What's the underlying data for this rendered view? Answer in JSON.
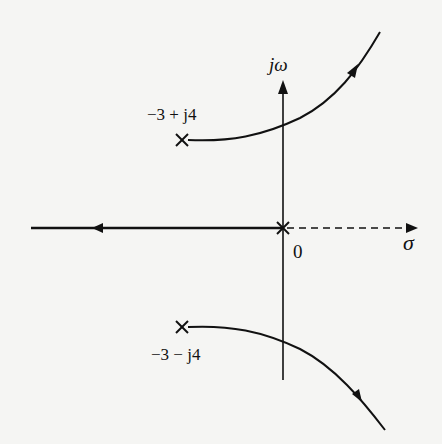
{
  "diagram": {
    "type": "root-locus",
    "axes": {
      "imag_label": "jω",
      "real_label": "σ",
      "origin_label": "0"
    },
    "poles": [
      {
        "label": "−3 + j4",
        "re": -3,
        "im": 4
      },
      {
        "label": "−3 − j4",
        "re": -3,
        "im": -4
      },
      {
        "label": "",
        "re": 0,
        "im": 0
      }
    ],
    "branches": [
      {
        "name": "upper-branch",
        "from": "−3 + j4",
        "direction": "to upper-right asymptote"
      },
      {
        "name": "lower-branch",
        "from": "−3 − j4",
        "direction": "to lower-right asymptote"
      },
      {
        "name": "real-axis-branch",
        "from": "0",
        "direction": "to −∞ along negative real axis"
      }
    ],
    "colors": {
      "ink": "#111111",
      "background": "#f5f5f3"
    }
  }
}
